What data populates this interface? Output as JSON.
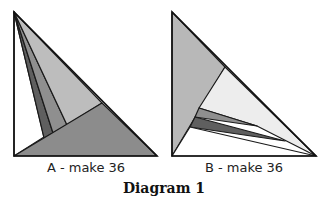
{
  "figures": [
    {
      "id": "A",
      "label": "A - make 36",
      "outline": [
        [
          14,
          12
        ],
        [
          14,
          156
        ],
        [
          157,
          156
        ]
      ],
      "pieces": [
        {
          "name": "white-left",
          "color": "#ffffff",
          "points": [
            [
              14,
              12
            ],
            [
              14,
              156
            ],
            [
              44,
              137
            ]
          ]
        },
        {
          "name": "dark-strip",
          "color": "#5f5f5f",
          "points": [
            [
              14,
              12
            ],
            [
              44,
              138
            ],
            [
              53,
              133
            ]
          ]
        },
        {
          "name": "medium-strip",
          "color": "#8f8f8f",
          "points": [
            [
              14,
              12
            ],
            [
              53,
              133
            ],
            [
              67,
              125
            ]
          ]
        },
        {
          "name": "light-wedge",
          "color": "#bdbdbd",
          "points": [
            [
              14,
              12
            ],
            [
              67,
              125
            ],
            [
              102,
              103
            ]
          ]
        },
        {
          "name": "big-gray-triangle",
          "color": "#8c8c8c",
          "points": [
            [
              14,
              156
            ],
            [
              157,
              156
            ],
            [
              102,
              103
            ]
          ]
        }
      ]
    },
    {
      "id": "B",
      "label": "B - make 36",
      "outline": [
        [
          172,
          12
        ],
        [
          172,
          156
        ],
        [
          316,
          156
        ]
      ],
      "pieces": [
        {
          "name": "big-gray-triangle",
          "color": "#b8b8b8",
          "points": [
            [
              172,
              12
            ],
            [
              225,
              67
            ],
            [
              172,
              156
            ]
          ]
        },
        {
          "name": "light-wedge",
          "color": "#ededed",
          "points": [
            [
              225,
              67
            ],
            [
              316,
              156
            ],
            [
              257,
              126
            ],
            [
              199,
              108
            ]
          ]
        },
        {
          "name": "medium-strip",
          "color": "#8f8f8f",
          "points": [
            [
              199,
              108
            ],
            [
              257,
              126
            ],
            [
              195,
              117
            ]
          ]
        },
        {
          "name": "dark-strip",
          "color": "#5f5f5f",
          "points": [
            [
              195,
              117
            ],
            [
              285,
              141
            ],
            [
              190,
              127
            ]
          ]
        },
        {
          "name": "white-bottom",
          "color": "#ffffff",
          "points": [
            [
              190,
              127
            ],
            [
              316,
              156
            ],
            [
              172,
              156
            ]
          ]
        }
      ]
    }
  ],
  "caption": "Diagram 1"
}
